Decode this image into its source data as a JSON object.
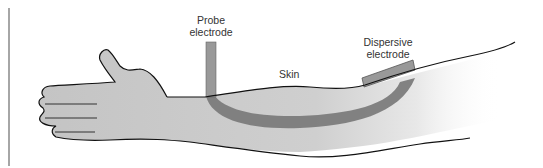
{
  "diagram": {
    "labels": {
      "probe": "Probe\nelectrode",
      "probe_line1": "Probe",
      "probe_line2": "electrode",
      "dispersive_line1": "Dispersive",
      "dispersive_line2": "electrode",
      "skin": "Skin"
    },
    "colors": {
      "arm_fill": "#c8c8c8",
      "current_path": "#7a7a7a",
      "electrode": "#999999",
      "outline": "#111111",
      "margin_line": "#888888"
    }
  }
}
